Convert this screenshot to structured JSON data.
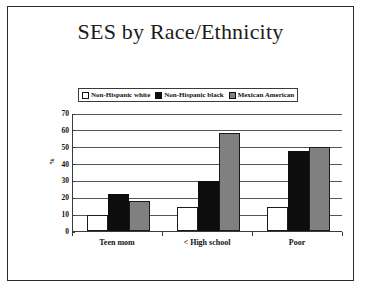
{
  "slide": {
    "title": "SES by Race/Ethnicity"
  },
  "chart_data": {
    "type": "bar",
    "title": "SES by Race/Ethnicity",
    "xlabel": "",
    "ylabel": "%",
    "ylim": [
      0,
      70
    ],
    "ytick_step": 10,
    "yticks": [
      70,
      60,
      50,
      40,
      30,
      20,
      10,
      0
    ],
    "grid": true,
    "legend_position": "top-center",
    "categories": [
      "Teen mom",
      "< High school",
      "Poor"
    ],
    "series": [
      {
        "name": "Non-Hispanic white",
        "color": "#ffffff",
        "values": [
          9.5,
          14,
          14
        ]
      },
      {
        "name": "Non-Hispanic black",
        "color": "#0d0d0d",
        "values": [
          22,
          29.5,
          47.5
        ]
      },
      {
        "name": "Mexican American",
        "color": "#808080",
        "values": [
          18,
          58,
          50
        ]
      }
    ]
  }
}
